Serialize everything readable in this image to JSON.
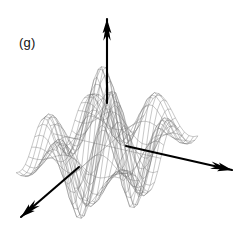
{
  "figure": {
    "panel_label": "(g)",
    "width": 241,
    "height": 232,
    "background_color": "#ffffff",
    "mesh_color": "#6e6e6e",
    "axis_color": "#000000",
    "label_color": "#111111"
  },
  "chart_data": {
    "type": "surface",
    "title": "(g)",
    "xlabel": "",
    "ylabel": "",
    "zlabel": "",
    "grid": false,
    "legend_position": "none",
    "render_style": "wireframe-mesh",
    "projection": "oblique-3d",
    "axes": [
      {
        "name": "vertical-axis",
        "label": "",
        "from": [
          107,
          103
        ],
        "to": [
          107,
          19
        ],
        "arrowhead": "up"
      },
      {
        "name": "right-axis",
        "label": "",
        "from": [
          126,
          146
        ],
        "to": [
          232,
          170
        ],
        "arrowhead": "right-down"
      },
      {
        "name": "left-axis",
        "label": "",
        "from": [
          79,
          167
        ],
        "to": [
          21,
          217
        ],
        "arrowhead": "left-down"
      }
    ],
    "xlim": [
      -3.2,
      3.2
    ],
    "ylim": [
      -3.2,
      3.2
    ],
    "zlim": [
      -1.0,
      1.0
    ],
    "nx": 25,
    "ny": 25,
    "surface_function": "z = sin(1.55*x)*sin(1.55*y)*exp(-0.11*(x*x+y*y))",
    "amplitude": 1.0,
    "peaks": [
      {
        "screen": [
          97,
          45
        ],
        "value": 0.95,
        "note": "tallest central peak"
      },
      {
        "screen": [
          118,
          62
        ],
        "value": 0.78,
        "note": "second central peak"
      },
      {
        "screen": [
          152,
          100
        ],
        "value": 0.48,
        "note": "right minor peak"
      },
      {
        "screen": [
          57,
          112
        ],
        "value": 0.42,
        "note": "left minor ridge"
      }
    ],
    "valleys": [
      {
        "screen": [
          79,
          200
        ],
        "value": -0.82,
        "note": "left-front deep valley"
      },
      {
        "screen": [
          112,
          196
        ],
        "value": -0.66,
        "note": "center-front valley"
      },
      {
        "screen": [
          150,
          188
        ],
        "value": -0.55,
        "note": "right-front valley"
      }
    ]
  }
}
